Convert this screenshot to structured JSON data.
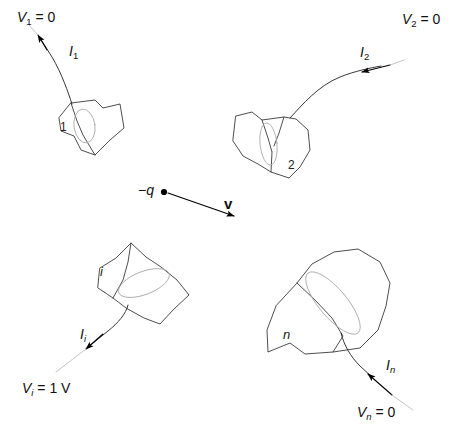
{
  "figure": {
    "type": "physics-diagram",
    "background_color": "#ffffff",
    "stroke_color": "#3a3a3a",
    "ellipse_color": "#9a9a9a",
    "arrow_color": "#000000"
  },
  "charge": {
    "label_symbol": "q",
    "label_sign": "−",
    "velocity_label": "v",
    "dot_name": "charge-dot"
  },
  "electrodes": [
    {
      "id": "1",
      "number_label": "1",
      "current_symbol": "I",
      "current_sub": "1",
      "potential_symbol": "V",
      "potential_sub": "1",
      "potential_value": "= 0",
      "potential_full": "V1 = 0"
    },
    {
      "id": "2",
      "number_label": "2",
      "current_symbol": "I",
      "current_sub": "2",
      "potential_symbol": "V",
      "potential_sub": "2",
      "potential_value": "= 0",
      "potential_full": "V2 = 0"
    },
    {
      "id": "i",
      "number_label": "i",
      "current_symbol": "I",
      "current_sub": "i",
      "potential_symbol": "V",
      "potential_sub": "i",
      "potential_value": "= 1 V",
      "potential_full": "Vi = 1 V"
    },
    {
      "id": "n",
      "number_label": "n",
      "current_symbol": "I",
      "current_sub": "n",
      "potential_symbol": "V",
      "potential_sub": "n",
      "potential_value": "= 0",
      "potential_full": "Vn = 0"
    }
  ]
}
